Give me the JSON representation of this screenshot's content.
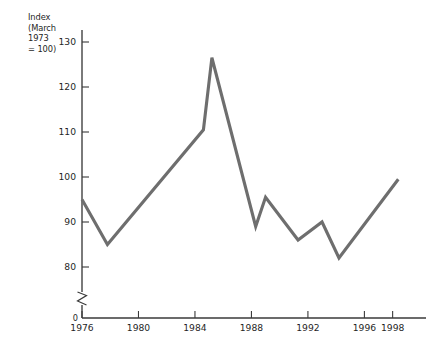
{
  "chart_data": {
    "type": "line",
    "title": "",
    "subtitle": "",
    "ylabel": "Index\n(March\n1973\n= 100)",
    "xlabel": "",
    "grid": false,
    "legend": "none",
    "xlim": [
      1975.0,
      1999.4
    ],
    "ylim": [
      78.0,
      131.5
    ],
    "y_axis_break": true,
    "y_break_label": "0",
    "yticks": [
      80,
      90,
      100,
      110,
      120,
      130
    ],
    "ytick_labels": [
      "80",
      "90",
      "100",
      "110",
      "120",
      "130"
    ],
    "xticks": [
      1976,
      1980,
      1984,
      1988,
      1992,
      1996,
      1998
    ],
    "xtick_labels": [
      "1976",
      "1980",
      "1984",
      "1988",
      "1992",
      "1996",
      "1998"
    ],
    "series": [
      {
        "name": "Index (March 1973 = 100)",
        "color": "#6e6e6e",
        "x": [
          1976.0,
          1977.8,
          1984.6,
          1985.2,
          1988.3,
          1989.0,
          1991.3,
          1993.0,
          1994.2,
          1998.4
        ],
        "values": [
          95.0,
          85.0,
          110.5,
          126.5,
          89.0,
          95.5,
          86.0,
          90.0,
          82.0,
          99.5
        ]
      }
    ],
    "annotations": []
  }
}
